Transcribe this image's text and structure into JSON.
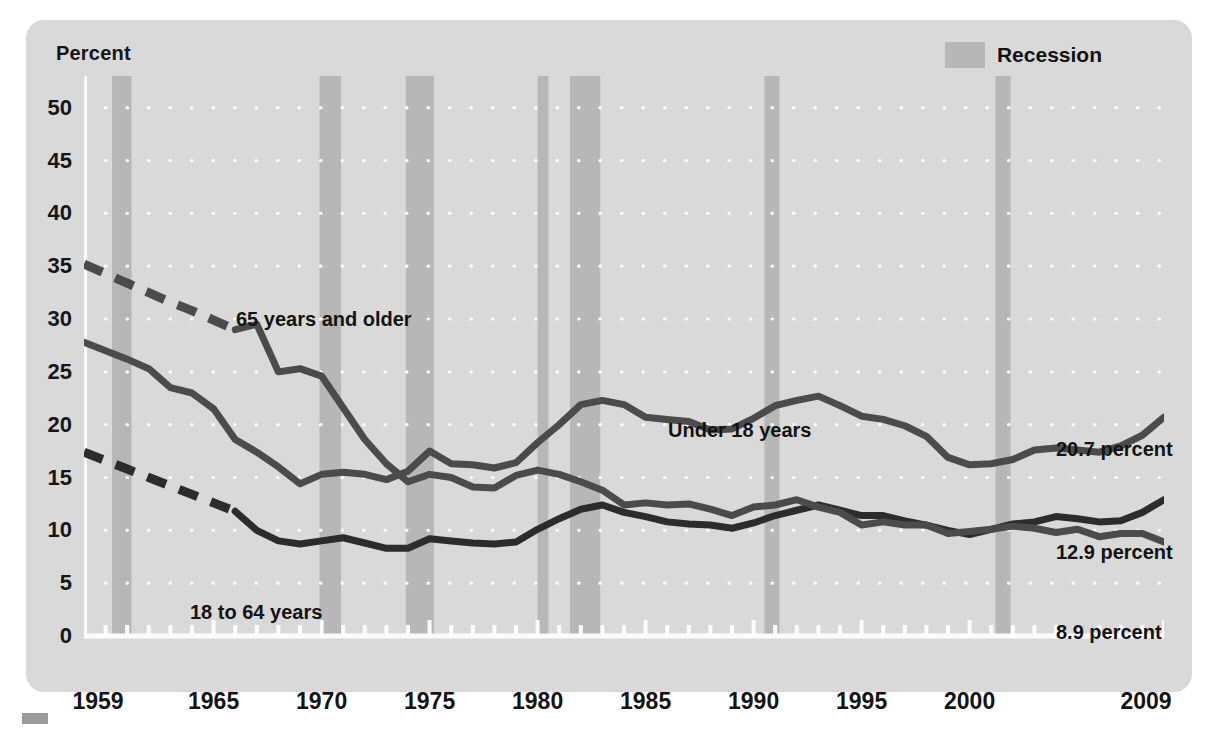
{
  "figure": {
    "axis_title": "Percent",
    "legend": {
      "label": "Recession",
      "swatch_color": "#b9b9b9"
    }
  },
  "annotations": {
    "series_65": "65 years and older",
    "series_18to64": "18 to 64 years",
    "series_under18": "Under 18 years",
    "end_under18": "20.7 percent",
    "end_18to64": "12.9 percent",
    "end_65": "8.9 percent"
  },
  "chart_data": {
    "type": "line",
    "title": "Percent",
    "xlabel": "",
    "ylabel": "Percent",
    "xlim": [
      1959,
      2009
    ],
    "ylim": [
      0,
      53
    ],
    "yticks": [
      0,
      5,
      10,
      15,
      20,
      25,
      30,
      35,
      40,
      45,
      50
    ],
    "xticks": [
      1959,
      1965,
      1970,
      1975,
      1980,
      1985,
      1990,
      1995,
      2000,
      2009
    ],
    "xtick_labels": [
      "1959",
      "1965",
      "1970",
      "1975",
      "1980",
      "1985",
      "1990",
      "1995",
      "2000",
      "2009"
    ],
    "ytick_labels": [
      "0",
      "5",
      "10",
      "15",
      "20",
      "25",
      "30",
      "35",
      "40",
      "45",
      "50"
    ],
    "grid": "dotted-white",
    "legend_position": "top-right",
    "series": [
      {
        "name": "Under 18 years",
        "color": "#4a4a4a",
        "style": "solid",
        "end_value": 20.7,
        "x": [
          1959,
          1960,
          1961,
          1962,
          1963,
          1964,
          1965,
          1966,
          1967,
          1968,
          1969,
          1970,
          1971,
          1972,
          1973,
          1974,
          1975,
          1976,
          1977,
          1978,
          1979,
          1980,
          1981,
          1982,
          1983,
          1984,
          1985,
          1986,
          1987,
          1988,
          1989,
          1990,
          1991,
          1992,
          1993,
          1994,
          1995,
          1996,
          1997,
          1998,
          1999,
          2000,
          2001,
          2002,
          2003,
          2004,
          2005,
          2006,
          2007,
          2008,
          2009
        ],
        "values": [
          27.8,
          27.0,
          26.2,
          25.3,
          23.5,
          23.0,
          21.5,
          18.6,
          17.4,
          16.0,
          14.4,
          15.3,
          15.5,
          15.3,
          14.8,
          15.6,
          17.5,
          16.3,
          16.2,
          15.9,
          16.4,
          18.3,
          20.0,
          21.9,
          22.3,
          21.9,
          20.7,
          20.5,
          20.3,
          19.5,
          19.6,
          20.6,
          21.8,
          22.3,
          22.7,
          21.8,
          20.8,
          20.5,
          19.9,
          18.9,
          16.9,
          16.2,
          16.3,
          16.7,
          17.6,
          17.8,
          17.6,
          17.4,
          18.0,
          19.0,
          20.7
        ]
      },
      {
        "name": "18 to 64 years",
        "color": "#2b2b2b",
        "style": "dashed-then-solid",
        "solid_from": 1966,
        "end_value": 12.9,
        "x": [
          1959,
          1960,
          1961,
          1962,
          1963,
          1964,
          1965,
          1966,
          1967,
          1968,
          1969,
          1970,
          1971,
          1972,
          1973,
          1974,
          1975,
          1976,
          1977,
          1978,
          1979,
          1980,
          1981,
          1982,
          1983,
          1984,
          1985,
          1986,
          1987,
          1988,
          1989,
          1990,
          1991,
          1992,
          1993,
          1994,
          1995,
          1996,
          1997,
          1998,
          1999,
          2000,
          2001,
          2002,
          2003,
          2004,
          2005,
          2006,
          2007,
          2008,
          2009
        ],
        "values": [
          17.4,
          16.6,
          15.8,
          15.0,
          14.2,
          13.4,
          12.6,
          11.8,
          10.0,
          9.0,
          8.7,
          9.0,
          9.3,
          8.8,
          8.3,
          8.3,
          9.2,
          9.0,
          8.8,
          8.7,
          8.9,
          10.1,
          11.1,
          12.0,
          12.4,
          11.7,
          11.3,
          10.8,
          10.6,
          10.5,
          10.2,
          10.7,
          11.4,
          11.9,
          12.4,
          11.9,
          11.4,
          11.4,
          10.9,
          10.5,
          10.0,
          9.6,
          10.1,
          10.6,
          10.8,
          11.3,
          11.1,
          10.8,
          10.9,
          11.7,
          12.9
        ]
      },
      {
        "name": "65 years and older",
        "color": "#4a4a4a",
        "style": "dashed-then-solid",
        "solid_from": 1966,
        "end_value": 8.9,
        "x": [
          1959,
          1960,
          1961,
          1962,
          1963,
          1964,
          1965,
          1966,
          1967,
          1968,
          1969,
          1970,
          1971,
          1972,
          1973,
          1974,
          1975,
          1976,
          1977,
          1978,
          1979,
          1980,
          1981,
          1982,
          1983,
          1984,
          1985,
          1986,
          1987,
          1988,
          1989,
          1990,
          1991,
          1992,
          1993,
          1994,
          1995,
          1996,
          1997,
          1998,
          1999,
          2000,
          2001,
          2002,
          2003,
          2004,
          2005,
          2006,
          2007,
          2008,
          2009
        ],
        "values": [
          35.2,
          34.3,
          33.4,
          32.5,
          31.6,
          30.8,
          29.9,
          29.0,
          29.5,
          25.0,
          25.3,
          24.6,
          21.6,
          18.6,
          16.3,
          14.6,
          15.3,
          15.0,
          14.1,
          14.0,
          15.2,
          15.7,
          15.3,
          14.6,
          13.8,
          12.4,
          12.6,
          12.4,
          12.5,
          12.0,
          11.4,
          12.2,
          12.4,
          12.9,
          12.2,
          11.7,
          10.5,
          10.8,
          10.5,
          10.5,
          9.7,
          9.9,
          10.1,
          10.4,
          10.2,
          9.8,
          10.1,
          9.4,
          9.7,
          9.7,
          8.9
        ]
      }
    ],
    "recession_bands": [
      {
        "start": 1960.3,
        "end": 1961.2
      },
      {
        "start": 1969.9,
        "end": 1970.9
      },
      {
        "start": 1973.9,
        "end": 1975.2
      },
      {
        "start": 1980.0,
        "end": 1980.5
      },
      {
        "start": 1981.5,
        "end": 1982.9
      },
      {
        "start": 1990.5,
        "end": 1991.2
      },
      {
        "start": 2001.2,
        "end": 2001.9
      }
    ],
    "recession_color": "#b9b9b9"
  }
}
